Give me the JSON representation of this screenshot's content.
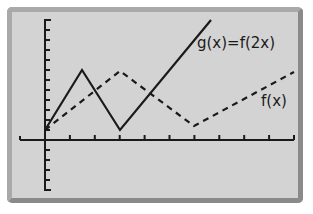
{
  "chart_data": {
    "type": "line",
    "title": "",
    "xlabel": "",
    "ylabel": "",
    "grid": false,
    "x_ticks": [
      0,
      1,
      2,
      3,
      4,
      5,
      6,
      7,
      8,
      9,
      10
    ],
    "y_ticks_above": 11,
    "y_ticks_below": 5,
    "series": [
      {
        "name": "g(x)=f(2x)",
        "style": "solid",
        "x": [
          0,
          1.5,
          3,
          6.6
        ],
        "y": [
          0.4,
          2.8,
          0.4,
          4.4
        ]
      },
      {
        "name": "f(x)",
        "style": "dashed",
        "x": [
          0,
          3,
          6,
          10
        ],
        "y": [
          0.4,
          2.8,
          0.6,
          2.7
        ]
      }
    ],
    "annotations": [
      {
        "text": "g(x)=f(2x)",
        "near_series": "g(x)=f(2x)"
      },
      {
        "text": "f(x)",
        "near_series": "f(x)"
      }
    ]
  },
  "labels": {
    "g": "g(x)=f(2x)",
    "f": "f(x)"
  }
}
